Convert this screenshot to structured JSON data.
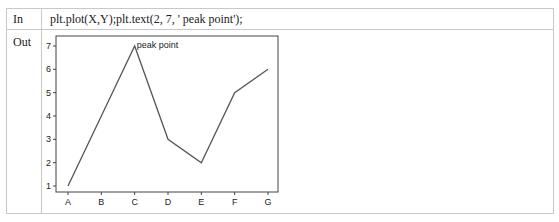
{
  "cell": {
    "in_label": "In",
    "out_label": "Out",
    "code": "plt.plot(X,Y);plt.text(2, 7, ' peak point');"
  },
  "colors": {
    "line": "#555555",
    "axes": "#444444",
    "border": "#c8c8c8"
  },
  "chart_data": {
    "type": "line",
    "title": "",
    "xlabel": "",
    "ylabel": "",
    "categories": [
      "A",
      "B",
      "C",
      "D",
      "E",
      "F",
      "G"
    ],
    "values": [
      1,
      4,
      7,
      3,
      2,
      5,
      6
    ],
    "yticks": [
      1,
      2,
      3,
      4,
      5,
      6,
      7
    ],
    "ylim": [
      0.7,
      7.3
    ],
    "grid": false,
    "legend": null,
    "annotations": [
      {
        "x": 2,
        "y": 7,
        "text": " peak point"
      }
    ]
  }
}
